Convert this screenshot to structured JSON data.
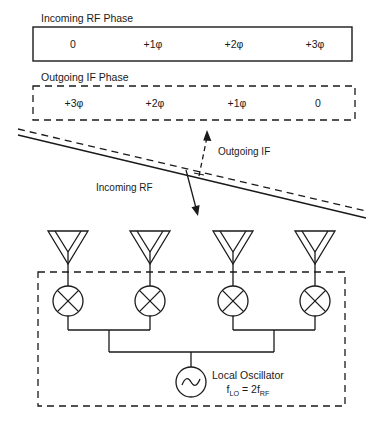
{
  "phase_table_rf": {
    "heading": "Incoming RF Phase",
    "border": "solid",
    "cells": [
      "0",
      "+1φ",
      "+2φ",
      "+3φ"
    ]
  },
  "phase_table_if": {
    "heading": "Outgoing IF Phase",
    "border": "dashed",
    "cells": [
      "+3φ",
      "+2φ",
      "+1φ",
      "0"
    ]
  },
  "wavefront": {
    "incoming_label": "Incoming RF",
    "outgoing_label": "Outgoing IF",
    "incoming_line_style": "solid",
    "outgoing_line_style": "dashed",
    "incoming_arrow_direction": "down",
    "outgoing_arrow_direction": "up"
  },
  "array": {
    "element_count": 4,
    "antenna_icon": "antenna-icon",
    "mixer_icon": "mixer-icon",
    "enclosure_style": "dashed"
  },
  "oscillator": {
    "icon": "sine-source-icon",
    "label": "Local Oscillator",
    "formula_prefix": "f",
    "formula_sub1": "LO",
    "formula_middle": " = 2f",
    "formula_sub2": "RF",
    "formula_plain": "f_LO = 2f_RF"
  },
  "colors": {
    "ink": "#1a1a1a",
    "background": "#ffffff"
  }
}
